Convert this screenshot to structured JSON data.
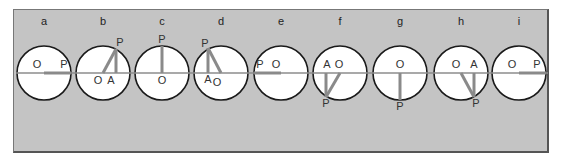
{
  "figure": {
    "panel_color": "#c4c4c4",
    "line_color": "#8a8a8a",
    "circle_radius": 27,
    "center_y": 73,
    "frames": [
      {
        "id": "a",
        "label": "a",
        "cx": 44,
        "P": [
          71,
          73
        ],
        "A": null,
        "labels": {
          "O": [
            37,
            68
          ],
          "P": [
            64,
            68
          ]
        }
      },
      {
        "id": "b",
        "label": "b",
        "cx": 103,
        "P": [
          116,
          49
        ],
        "A": [
          116,
          73
        ],
        "labels": {
          "O": [
            98,
            84
          ],
          "A": [
            111,
            84
          ],
          "P": [
            120,
            46
          ]
        }
      },
      {
        "id": "c",
        "label": "c",
        "cx": 162,
        "P": [
          162,
          46
        ],
        "A": null,
        "labels": {
          "O": [
            162,
            84
          ],
          "P": [
            162,
            43
          ]
        }
      },
      {
        "id": "d",
        "label": "d",
        "cx": 221,
        "P": [
          208,
          48
        ],
        "A": [
          208,
          73
        ],
        "labels": {
          "P": [
            205,
            47
          ],
          "A": [
            208,
            83
          ],
          "O": [
            217,
            86
          ]
        }
      },
      {
        "id": "e",
        "label": "e",
        "cx": 281,
        "P": [
          254,
          73
        ],
        "A": null,
        "labels": {
          "P": [
            260,
            68
          ],
          "O": [
            276,
            68
          ]
        }
      },
      {
        "id": "f",
        "label": "f",
        "cx": 340,
        "P": [
          326,
          97
        ],
        "A": [
          326,
          73
        ],
        "labels": {
          "A": [
            327,
            68
          ],
          "O": [
            339,
            68
          ],
          "P": [
            326,
            107
          ]
        }
      },
      {
        "id": "g",
        "label": "g",
        "cx": 400,
        "P": [
          400,
          100
        ],
        "A": null,
        "labels": {
          "O": [
            400,
            68
          ],
          "P": [
            400,
            110
          ]
        }
      },
      {
        "id": "h",
        "label": "h",
        "cx": 461,
        "P": [
          474,
          97
        ],
        "A": [
          474,
          73
        ],
        "labels": {
          "O": [
            456,
            68
          ],
          "A": [
            474,
            68
          ],
          "P": [
            476,
            107
          ]
        }
      },
      {
        "id": "i",
        "label": "i",
        "cx": 519,
        "P": [
          546,
          73
        ],
        "A": null,
        "labels": {
          "O": [
            512,
            68
          ],
          "P": [
            537,
            68
          ]
        }
      }
    ],
    "label_y": 21,
    "point_names": {
      "O": "O",
      "P": "P",
      "A": "A"
    }
  }
}
